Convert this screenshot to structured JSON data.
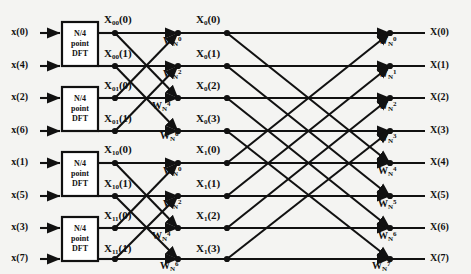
{
  "figure": {
    "type": "signal-flow-graph",
    "name": "8-point decimation-in-time FFT butterfly diagram",
    "background_color": "#f4f4f2",
    "line_color": "#111111",
    "width": 471,
    "height": 274
  },
  "inputs": [
    {
      "label": "x(0)",
      "x": 28,
      "y": 33
    },
    {
      "label": "x(4)",
      "x": 28,
      "y": 66
    },
    {
      "label": "x(2)",
      "x": 28,
      "y": 98
    },
    {
      "label": "x(6)",
      "x": 28,
      "y": 131
    },
    {
      "label": "x(1)",
      "x": 28,
      "y": 163
    },
    {
      "label": "x(5)",
      "x": 28,
      "y": 196
    },
    {
      "label": "x(3)",
      "x": 28,
      "y": 228
    },
    {
      "label": "x(7)",
      "x": 28,
      "y": 259
    }
  ],
  "dft_blocks": [
    {
      "name": "dft-block-1",
      "line1": "N/4",
      "line2": "point",
      "line3": "DFT",
      "x": 62,
      "y": 22,
      "w": 36,
      "h": 44
    },
    {
      "name": "dft-block-2",
      "line1": "N/4",
      "line2": "point",
      "line3": "DFT",
      "x": 62,
      "y": 87,
      "w": 36,
      "h": 44
    },
    {
      "name": "dft-block-3",
      "line1": "N/4",
      "line2": "point",
      "line3": "DFT",
      "x": 62,
      "y": 152,
      "w": 36,
      "h": 44
    },
    {
      "name": "dft-block-4",
      "line1": "N/4",
      "line2": "point",
      "line3": "DFT",
      "x": 62,
      "y": 217,
      "w": 36,
      "h": 44
    }
  ],
  "stage1_labels": [
    {
      "base": "X",
      "sub": "00",
      "arg": "(0)",
      "x": 104,
      "y": 14
    },
    {
      "base": "X",
      "sub": "00",
      "arg": "(1)",
      "x": 104,
      "y": 48
    },
    {
      "base": "X",
      "sub": "01",
      "arg": "(0)",
      "x": 104,
      "y": 80
    },
    {
      "base": "X",
      "sub": "01",
      "arg": "(1)",
      "x": 104,
      "y": 113
    },
    {
      "base": "X",
      "sub": "10",
      "arg": "(0)",
      "x": 104,
      "y": 144
    },
    {
      "base": "X",
      "sub": "10",
      "arg": "(1)",
      "x": 104,
      "y": 178
    },
    {
      "base": "X",
      "sub": "11",
      "arg": "(0)",
      "x": 104,
      "y": 210
    },
    {
      "base": "X",
      "sub": "11",
      "arg": "(1)",
      "x": 104,
      "y": 243
    }
  ],
  "stage2_labels": [
    {
      "base": "X",
      "sub": "0",
      "arg": "(0)",
      "x": 196,
      "y": 14
    },
    {
      "base": "X",
      "sub": "0",
      "arg": "(1)",
      "x": 196,
      "y": 48
    },
    {
      "base": "X",
      "sub": "0",
      "arg": "(2)",
      "x": 196,
      "y": 80
    },
    {
      "base": "X",
      "sub": "0",
      "arg": "(3)",
      "x": 196,
      "y": 113
    },
    {
      "base": "X",
      "sub": "1",
      "arg": "(0)",
      "x": 196,
      "y": 144
    },
    {
      "base": "X",
      "sub": "1",
      "arg": "(1)",
      "x": 196,
      "y": 178
    },
    {
      "base": "X",
      "sub": "1",
      "arg": "(2)",
      "x": 196,
      "y": 210
    },
    {
      "base": "X",
      "sub": "1",
      "arg": "(3)",
      "x": 196,
      "y": 243
    }
  ],
  "stage2_twiddles": [
    {
      "base": "W",
      "sub": "N",
      "sup": "0",
      "x": 163,
      "y": 36
    },
    {
      "base": "W",
      "sub": "N",
      "sup": "2",
      "x": 163,
      "y": 69
    },
    {
      "base": "W",
      "sub": "N",
      "sup": "4",
      "x": 152,
      "y": 101
    },
    {
      "base": "W",
      "sub": "N",
      "sup": "6",
      "x": 160,
      "y": 131
    },
    {
      "base": "W",
      "sub": "N",
      "sup": "0",
      "x": 163,
      "y": 166
    },
    {
      "base": "W",
      "sub": "N",
      "sup": "2",
      "x": 163,
      "y": 199
    },
    {
      "base": "W",
      "sub": "N",
      "sup": "4",
      "x": 152,
      "y": 231
    },
    {
      "base": "W",
      "sub": "N",
      "sup": "6",
      "x": 160,
      "y": 261
    }
  ],
  "stage3_twiddles": [
    {
      "base": "W",
      "sub": "N",
      "sup": "0",
      "x": 378,
      "y": 36
    },
    {
      "base": "W",
      "sub": "N",
      "sup": "1",
      "x": 378,
      "y": 69
    },
    {
      "base": "W",
      "sub": "N",
      "sup": "2",
      "x": 378,
      "y": 101
    },
    {
      "base": "W",
      "sub": "N",
      "sup": "3",
      "x": 378,
      "y": 133
    },
    {
      "base": "W",
      "sub": "N",
      "sup": "4",
      "x": 378,
      "y": 166
    },
    {
      "base": "W",
      "sub": "N",
      "sup": "5",
      "x": 378,
      "y": 199
    },
    {
      "base": "W",
      "sub": "N",
      "sup": "6",
      "x": 378,
      "y": 231
    },
    {
      "base": "W",
      "sub": "N",
      "sup": "7",
      "x": 372,
      "y": 261
    }
  ],
  "outputs": [
    {
      "label": "X(0)",
      "x": 430,
      "y": 33
    },
    {
      "label": "X(1)",
      "x": 430,
      "y": 66
    },
    {
      "label": "X(2)",
      "x": 430,
      "y": 98
    },
    {
      "label": "X(3)",
      "x": 430,
      "y": 131
    },
    {
      "label": "X(4)",
      "x": 430,
      "y": 163
    },
    {
      "label": "X(5)",
      "x": 430,
      "y": 196
    },
    {
      "label": "X(6)",
      "x": 430,
      "y": 228
    },
    {
      "label": "X(7)",
      "x": 430,
      "y": 259
    }
  ],
  "geometry": {
    "rows_y": [
      33,
      66,
      98,
      131,
      163,
      196,
      228,
      259
    ],
    "input_arrow_x1": 40,
    "input_arrow_x2": 60,
    "block_right_x": 98,
    "stage1_node_x": 115,
    "stage2_node_x": 178,
    "stage3_node_x": 227,
    "stage4_node_x": 390,
    "output_line_end_x": 425,
    "stage2_pairs": [
      [
        0,
        2
      ],
      [
        1,
        3
      ],
      [
        4,
        6
      ],
      [
        5,
        7
      ]
    ],
    "stage3_pairs": [
      [
        0,
        4
      ],
      [
        1,
        5
      ],
      [
        2,
        6
      ],
      [
        3,
        7
      ]
    ]
  }
}
